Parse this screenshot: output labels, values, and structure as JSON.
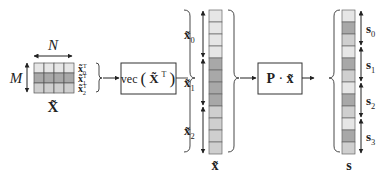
{
  "matrix": {
    "label": "X̃",
    "width_label": "N",
    "height_label": "M",
    "rows": 3,
    "cols": 4,
    "row_labels": [
      {
        "base": "x̃",
        "sub": "0",
        "sup": "T"
      },
      {
        "base": "x̃",
        "sub": "1",
        "sup": "T"
      },
      {
        "base": "x̃",
        "sub": "2",
        "sup": "T"
      }
    ],
    "row_colors": [
      "#e6e6e6",
      "#a8a8a8",
      "#cfcfcf"
    ]
  },
  "vec_box": {
    "label_prefix": "vec",
    "label_base": "X̃",
    "label_sup": "T"
  },
  "x_vector": {
    "label": "x̃",
    "segments": [
      {
        "base": "x̃",
        "sub": "0",
        "cells": 4,
        "color": "#e6e6e6"
      },
      {
        "base": "x̃",
        "sub": "1",
        "cells": 4,
        "color": "#a8a8a8"
      },
      {
        "base": "x̃",
        "sub": "2",
        "cells": 4,
        "color": "#cfcfcf"
      }
    ]
  },
  "p_box": {
    "label_p": "P",
    "label_dot": "·",
    "label_x": "x̃"
  },
  "s_vector": {
    "label": "s",
    "cell_colors": [
      "#e6e6e6",
      "#a8a8a8",
      "#cfcfcf"
    ],
    "segments": [
      {
        "base": "s",
        "sub": "0",
        "cells": 3
      },
      {
        "base": "s",
        "sub": "1",
        "cells": 3
      },
      {
        "base": "s",
        "sub": "2",
        "cells": 3
      },
      {
        "base": "s",
        "sub": "3",
        "cells": 3
      }
    ]
  }
}
